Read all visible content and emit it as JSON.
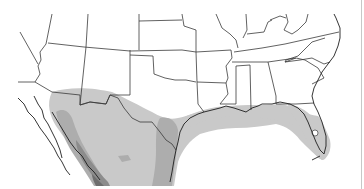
{
  "map": {
    "type": "species-range-map",
    "region": "Southern United States and northern Mexico",
    "background": "#ffffff",
    "border_color": "#3a3a3a",
    "range_levels": [
      {
        "name": "range-light",
        "color": "#c9c9c9"
      },
      {
        "name": "range-medium",
        "color": "#adadad"
      },
      {
        "name": "range-dark",
        "color": "#8c8c8c"
      },
      {
        "name": "range-darkest",
        "color": "#6e6e6e"
      }
    ],
    "frame_edge_color": "#c8c8c8"
  }
}
